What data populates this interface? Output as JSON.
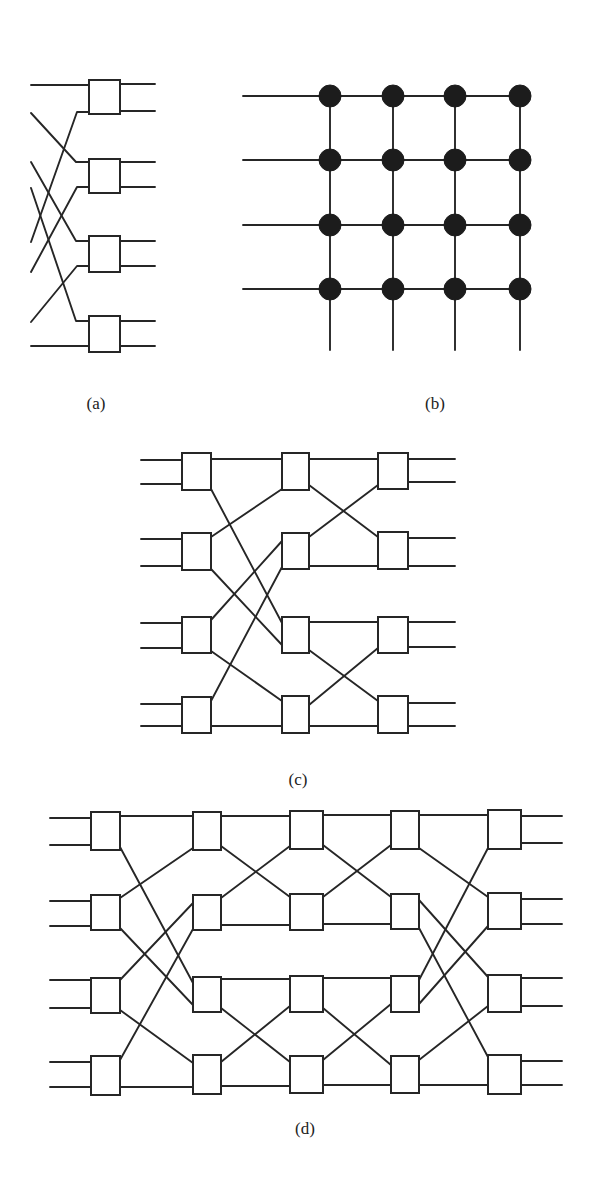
{
  "figure": {
    "panels": [
      {
        "id": "a",
        "caption": "(a)",
        "caption_pos": [
          96,
          404
        ],
        "kind": "switch-network",
        "boxes": [
          [
            89,
            80,
            31,
            34
          ],
          [
            89,
            159,
            31,
            34
          ],
          [
            89,
            236,
            31,
            36
          ],
          [
            89,
            316,
            31,
            36
          ]
        ],
        "wires": [
          [
            [
              31,
              85
            ],
            [
              89,
              85
            ]
          ],
          [
            [
              31,
              113
            ],
            [
              76,
              162
            ],
            [
              89,
              162
            ]
          ],
          [
            [
              31,
              162
            ],
            [
              76,
              241
            ],
            [
              89,
              241
            ]
          ],
          [
            [
              31,
              188
            ],
            [
              76,
              321
            ],
            [
              89,
              321
            ]
          ],
          [
            [
              31,
              242
            ],
            [
              77,
              112
            ],
            [
              89,
              112
            ]
          ],
          [
            [
              31,
              272
            ],
            [
              77,
              187
            ],
            [
              89,
              187
            ]
          ],
          [
            [
              31,
              322
            ],
            [
              77,
              266
            ],
            [
              89,
              266
            ]
          ],
          [
            [
              31,
              346
            ],
            [
              89,
              346
            ]
          ],
          [
            [
              120,
              84
            ],
            [
              155,
              84
            ]
          ],
          [
            [
              120,
              111
            ],
            [
              155,
              111
            ]
          ],
          [
            [
              120,
              162
            ],
            [
              155,
              162
            ]
          ],
          [
            [
              120,
              187
            ],
            [
              155,
              187
            ]
          ],
          [
            [
              120,
              241
            ],
            [
              155,
              241
            ]
          ],
          [
            [
              120,
              266
            ],
            [
              155,
              266
            ]
          ],
          [
            [
              120,
              321
            ],
            [
              155,
              321
            ]
          ],
          [
            [
              120,
              346
            ],
            [
              155,
              346
            ]
          ]
        ]
      },
      {
        "id": "b",
        "caption": "(b)",
        "caption_pos": [
          435,
          404
        ],
        "kind": "crossbar",
        "columns_x": [
          330,
          393,
          455,
          520
        ],
        "rows_y": [
          96,
          160,
          225,
          289
        ],
        "input_start_x": 243,
        "bottom_y": 350,
        "node_radius": 11
      },
      {
        "id": "c",
        "caption": "(c)",
        "caption_pos": [
          298,
          780
        ],
        "kind": "switch-network",
        "boxes": [
          [
            182,
            453,
            29,
            37
          ],
          [
            182,
            533,
            29,
            37
          ],
          [
            182,
            617,
            29,
            36
          ],
          [
            182,
            697,
            29,
            36
          ],
          [
            282,
            453,
            27,
            37
          ],
          [
            282,
            533,
            27,
            36
          ],
          [
            282,
            617,
            27,
            36
          ],
          [
            282,
            696,
            27,
            37
          ],
          [
            378,
            453,
            30,
            36
          ],
          [
            378,
            532,
            30,
            37
          ],
          [
            378,
            617,
            30,
            36
          ],
          [
            378,
            696,
            30,
            37
          ]
        ],
        "wires": [
          [
            [
              141,
              460
            ],
            [
              182,
              460
            ]
          ],
          [
            [
              141,
              484
            ],
            [
              182,
              484
            ]
          ],
          [
            [
              141,
              539
            ],
            [
              182,
              539
            ]
          ],
          [
            [
              141,
              566
            ],
            [
              182,
              566
            ]
          ],
          [
            [
              141,
              623
            ],
            [
              182,
              623
            ]
          ],
          [
            [
              141,
              648
            ],
            [
              182,
              648
            ]
          ],
          [
            [
              141,
              704
            ],
            [
              182,
              704
            ]
          ],
          [
            [
              141,
              726
            ],
            [
              182,
              726
            ]
          ],
          [
            [
              211,
              459
            ],
            [
              282,
              459
            ]
          ],
          [
            [
              211,
              489
            ],
            [
              282,
              623
            ]
          ],
          [
            [
              211,
              537
            ],
            [
              282,
              489
            ]
          ],
          [
            [
              211,
              569
            ],
            [
              282,
              645
            ]
          ],
          [
            [
              211,
              620
            ],
            [
              282,
              541
            ]
          ],
          [
            [
              211,
              651
            ],
            [
              282,
              701
            ]
          ],
          [
            [
              211,
              701
            ],
            [
              282,
              567
            ]
          ],
          [
            [
              211,
              726
            ],
            [
              282,
              726
            ]
          ],
          [
            [
              309,
              459
            ],
            [
              378,
              459
            ]
          ],
          [
            [
              309,
              485
            ],
            [
              378,
              537
            ]
          ],
          [
            [
              309,
              537
            ],
            [
              378,
              485
            ]
          ],
          [
            [
              309,
              566
            ],
            [
              378,
              566
            ]
          ],
          [
            [
              309,
              622
            ],
            [
              378,
              622
            ]
          ],
          [
            [
              309,
              650
            ],
            [
              378,
              701
            ]
          ],
          [
            [
              309,
              705
            ],
            [
              378,
              648
            ]
          ],
          [
            [
              309,
              726
            ],
            [
              378,
              726
            ]
          ],
          [
            [
              408,
              459
            ],
            [
              455,
              459
            ]
          ],
          [
            [
              408,
              482
            ],
            [
              455,
              482
            ]
          ],
          [
            [
              408,
              538
            ],
            [
              455,
              538
            ]
          ],
          [
            [
              408,
              566
            ],
            [
              455,
              566
            ]
          ],
          [
            [
              408,
              622
            ],
            [
              455,
              622
            ]
          ],
          [
            [
              408,
              647
            ],
            [
              455,
              647
            ]
          ],
          [
            [
              408,
              703
            ],
            [
              455,
              703
            ]
          ],
          [
            [
              408,
              726
            ],
            [
              455,
              726
            ]
          ]
        ]
      },
      {
        "id": "d",
        "caption": "(d)",
        "caption_pos": [
          305,
          1129
        ],
        "kind": "switch-network",
        "boxes": [
          [
            91,
            812,
            29,
            38
          ],
          [
            91,
            895,
            29,
            35
          ],
          [
            91,
            978,
            29,
            35
          ],
          [
            91,
            1056,
            29,
            39
          ],
          [
            193,
            812,
            28,
            38
          ],
          [
            193,
            895,
            28,
            35
          ],
          [
            193,
            977,
            28,
            35
          ],
          [
            193,
            1055,
            28,
            39
          ],
          [
            290,
            811,
            33,
            38
          ],
          [
            290,
            894,
            33,
            36
          ],
          [
            290,
            976,
            33,
            36
          ],
          [
            290,
            1056,
            33,
            37
          ],
          [
            391,
            811,
            28,
            38
          ],
          [
            391,
            894,
            28,
            35
          ],
          [
            391,
            976,
            28,
            36
          ],
          [
            391,
            1056,
            28,
            37
          ],
          [
            488,
            810,
            33,
            39
          ],
          [
            488,
            893,
            33,
            36
          ],
          [
            488,
            975,
            33,
            37
          ],
          [
            488,
            1055,
            33,
            39
          ]
        ],
        "wires": [
          [
            [
              50,
              818
            ],
            [
              91,
              818
            ]
          ],
          [
            [
              50,
              845
            ],
            [
              91,
              845
            ]
          ],
          [
            [
              50,
              901
            ],
            [
              91,
              901
            ]
          ],
          [
            [
              50,
              926
            ],
            [
              91,
              926
            ]
          ],
          [
            [
              50,
              980
            ],
            [
              91,
              980
            ]
          ],
          [
            [
              50,
              1008
            ],
            [
              91,
              1008
            ]
          ],
          [
            [
              50,
              1062
            ],
            [
              91,
              1062
            ]
          ],
          [
            [
              50,
              1087
            ],
            [
              91,
              1087
            ]
          ],
          [
            [
              120,
              816
            ],
            [
              193,
              816
            ]
          ],
          [
            [
              120,
              847
            ],
            [
              193,
              983
            ]
          ],
          [
            [
              120,
              898
            ],
            [
              193,
              848
            ]
          ],
          [
            [
              120,
              928
            ],
            [
              193,
              1005
            ]
          ],
          [
            [
              120,
              980
            ],
            [
              193,
              903
            ]
          ],
          [
            [
              120,
              1010
            ],
            [
              193,
              1063
            ]
          ],
          [
            [
              120,
              1060
            ],
            [
              193,
              929
            ]
          ],
          [
            [
              120,
              1087
            ],
            [
              193,
              1087
            ]
          ],
          [
            [
              221,
              816
            ],
            [
              290,
              816
            ]
          ],
          [
            [
              221,
              846
            ],
            [
              290,
              897
            ]
          ],
          [
            [
              221,
              898
            ],
            [
              290,
              846
            ]
          ],
          [
            [
              221,
              925
            ],
            [
              290,
              925
            ]
          ],
          [
            [
              221,
              979
            ],
            [
              290,
              979
            ]
          ],
          [
            [
              221,
              1008
            ],
            [
              290,
              1062
            ]
          ],
          [
            [
              221,
              1062
            ],
            [
              290,
              1006
            ]
          ],
          [
            [
              221,
              1086
            ],
            [
              290,
              1086
            ]
          ],
          [
            [
              323,
              815
            ],
            [
              391,
              815
            ]
          ],
          [
            [
              323,
              845
            ],
            [
              391,
              897
            ]
          ],
          [
            [
              323,
              897
            ],
            [
              391,
              845
            ]
          ],
          [
            [
              323,
              924
            ],
            [
              391,
              924
            ]
          ],
          [
            [
              323,
              978
            ],
            [
              391,
              978
            ]
          ],
          [
            [
              323,
              1008
            ],
            [
              391,
              1065
            ]
          ],
          [
            [
              323,
              1060
            ],
            [
              391,
              1004
            ]
          ],
          [
            [
              323,
              1085
            ],
            [
              391,
              1085
            ]
          ],
          [
            [
              419,
              815
            ],
            [
              488,
              815
            ]
          ],
          [
            [
              419,
              848
            ],
            [
              488,
              897
            ]
          ],
          [
            [
              419,
              900
            ],
            [
              488,
              977
            ]
          ],
          [
            [
              419,
              928
            ],
            [
              488,
              1057
            ]
          ],
          [
            [
              419,
              980
            ],
            [
              488,
              848
            ]
          ],
          [
            [
              419,
              1004
            ],
            [
              488,
              926
            ]
          ],
          [
            [
              419,
              1060
            ],
            [
              488,
              1006
            ]
          ],
          [
            [
              419,
              1085
            ],
            [
              488,
              1085
            ]
          ],
          [
            [
              521,
              816
            ],
            [
              562,
              816
            ]
          ],
          [
            [
              521,
              843
            ],
            [
              562,
              843
            ]
          ],
          [
            [
              521,
              899
            ],
            [
              562,
              899
            ]
          ],
          [
            [
              521,
              924
            ],
            [
              562,
              924
            ]
          ],
          [
            [
              521,
              978
            ],
            [
              562,
              978
            ]
          ],
          [
            [
              521,
              1006
            ],
            [
              562,
              1006
            ]
          ],
          [
            [
              521,
              1061
            ],
            [
              562,
              1061
            ]
          ],
          [
            [
              521,
              1085
            ],
            [
              562,
              1085
            ]
          ]
        ]
      }
    ]
  },
  "captions": {
    "a": "(a)",
    "b": "(b)",
    "c": "(c)",
    "d": "(d)"
  }
}
